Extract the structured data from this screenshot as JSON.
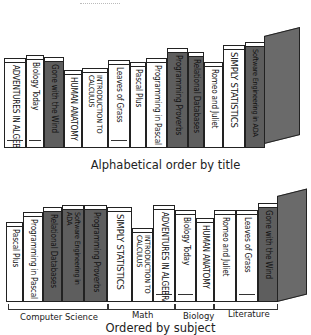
{
  "top_shelf": {
    "caption": "Alphabetical order by title",
    "books": [
      {
        "title": "ADVENTURES IN ALGEBRA",
        "style": "light"
      },
      {
        "title": "Biology Today",
        "style": "light"
      },
      {
        "title": "Gone with the Wind",
        "style": "dark"
      },
      {
        "title": "HUMAN ANATOMY",
        "style": "light"
      },
      {
        "title": "INTRODUCTION TO CALCULUS",
        "style": "light"
      },
      {
        "title": "Leaves of Grass",
        "style": "light"
      },
      {
        "title": "Pascal Plus",
        "style": "light"
      },
      {
        "title": "Programming in Pascal",
        "style": "light"
      },
      {
        "title": "Programming Proverbs",
        "style": "dark"
      },
      {
        "title": "Relational Databases",
        "style": "dark"
      },
      {
        "title": "Romeo and Juliet",
        "style": "light"
      },
      {
        "title": "SIMPLY STATISTICS",
        "style": "light"
      },
      {
        "title": "Software Engineering in ADA",
        "style": "dark"
      }
    ]
  },
  "bottom_shelf": {
    "caption": "Ordered by subject",
    "books": [
      {
        "title": "Pascal Plus",
        "style": "light"
      },
      {
        "title": "Programming in Pascal",
        "style": "light"
      },
      {
        "title": "Relational Databases",
        "style": "dark"
      },
      {
        "title": "Software Engineering in ADA",
        "style": "dark"
      },
      {
        "title": "Programming Proverbs",
        "style": "dark"
      },
      {
        "title": "SIMPLY STATISTICS",
        "style": "light"
      },
      {
        "title": "INTRODUCTION TO CALCULUS",
        "style": "light"
      },
      {
        "title": "ADVENTURES IN ALGEBRA",
        "style": "light"
      },
      {
        "title": "Biology Today",
        "style": "light"
      },
      {
        "title": "HUMAN ANATOMY",
        "style": "light"
      },
      {
        "title": "Romeo and Juliet",
        "style": "light"
      },
      {
        "title": "Leaves of Grass",
        "style": "light"
      },
      {
        "title": "Gone with the Wind",
        "style": "dark"
      }
    ],
    "groups": [
      {
        "label": "Computer Science"
      },
      {
        "label": "Math"
      },
      {
        "label": "Biology"
      },
      {
        "label": "Literature"
      }
    ]
  },
  "colors": {
    "dark_book": "#5e5e5e",
    "light_book": "#ffffff",
    "ink": "#222222"
  }
}
